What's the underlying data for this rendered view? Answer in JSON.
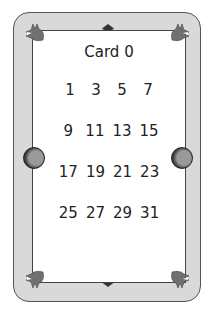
{
  "card": {
    "title": "Card 0",
    "rows": [
      [
        "1",
        "3",
        "5",
        "7"
      ],
      [
        "9",
        "11",
        "13",
        "15"
      ],
      [
        "17",
        "19",
        "21",
        "23"
      ],
      [
        "25",
        "27",
        "29",
        "31"
      ]
    ]
  },
  "colors": {
    "frame": "#d9d9d9",
    "corner": "#707070",
    "knob": "#9a9a9a",
    "border": "#444444"
  },
  "icons": [
    "corner-claw-icon",
    "diamond-ornament-icon",
    "knob-icon"
  ]
}
